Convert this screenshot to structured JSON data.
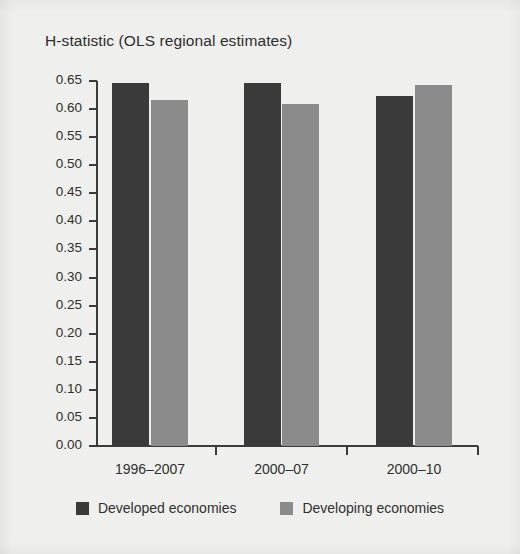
{
  "chart_data": {
    "type": "bar",
    "title": "H-statistic (OLS regional estimates)",
    "xlabel": "",
    "ylabel": "",
    "categories": [
      "1996–2007",
      "2000–07",
      "2000–10"
    ],
    "series": [
      {
        "name": "Developed economies",
        "color": "#3a3a3a",
        "values": [
          0.647,
          0.647,
          0.623
        ]
      },
      {
        "name": "Developing economies",
        "color": "#8b8b8b",
        "values": [
          0.616,
          0.609,
          0.643
        ]
      }
    ],
    "ylim": [
      0.0,
      0.65
    ],
    "ytick_step": 0.05,
    "ytick_labels": [
      "0.65",
      "0.60",
      "0.55",
      "0.50",
      "0.45",
      "0.40",
      "0.35",
      "0.30",
      "0.25",
      "0.20",
      "0.15",
      "0.10",
      "0.05",
      "0.00"
    ],
    "ytick_values": [
      0.65,
      0.6,
      0.55,
      0.5,
      0.45,
      0.4,
      0.35,
      0.3,
      0.25,
      0.2,
      0.15,
      0.1,
      0.05,
      0.0
    ],
    "grid": false,
    "legend_position": "bottom",
    "background_color": "#efefed",
    "axis_color": "#3b3b3b",
    "text_color": "#2f2f2f"
  }
}
